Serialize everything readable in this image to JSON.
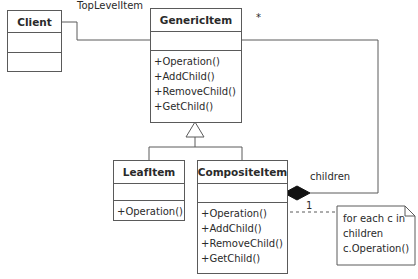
{
  "diagram": {
    "type": "UML class diagram (Composite pattern)",
    "classes": {
      "client": {
        "name": "Client",
        "operations": []
      },
      "generic_item": {
        "name": "GenericItem",
        "operations": [
          "+Operation()",
          "+AddChild()",
          "+RemoveChild()",
          "+GetChild()"
        ]
      },
      "leaf_item": {
        "name": "LeafItem",
        "operations": [
          "+Operation()"
        ]
      },
      "composite_item": {
        "name": "CompositeItem",
        "operations": [
          "+Operation()",
          "+AddChild()",
          "+RemoveChild()",
          "+GetChild()"
        ]
      }
    },
    "associations": {
      "client_to_generic": {
        "role": "TopLevelItem"
      },
      "composite_children": {
        "role": "children",
        "multiplicity_many": "*",
        "multiplicity_one": "1"
      }
    },
    "note": {
      "lines": [
        "for each c in",
        "children",
        "c.Operation()"
      ]
    },
    "colors": {
      "line": "#5a5a5a",
      "text": "#2a2a2a",
      "background": "#ffffff"
    }
  }
}
